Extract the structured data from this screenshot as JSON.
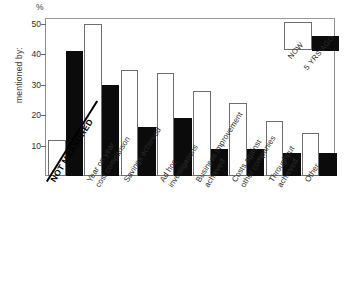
{
  "chart_data": {
    "type": "bar",
    "title": "",
    "xlabel": "",
    "ylabel": "mentioned by:",
    "yunit": "%",
    "ylim": [
      0,
      52
    ],
    "yticks": [
      10,
      20,
      30,
      40,
      50
    ],
    "grid": false,
    "legend_position": "top-right",
    "categories": [
      "NOT MEASURED",
      "Year on year cost comparison",
      "Savings achieved",
      "Ad hoc investigations",
      "Business improvement achieved",
      "Costs against other companies",
      "Throughput achieved",
      "Other"
    ],
    "category_lines": [
      [
        "NOT MEASURED"
      ],
      [
        "Year on year",
        "cost comparison"
      ],
      [
        "Savings achieved"
      ],
      [
        "Ad hoc",
        "investigations"
      ],
      [
        "Business improvement",
        "achieved"
      ],
      [
        "Costs against",
        "other companies"
      ],
      [
        "Throughput",
        "achieved"
      ],
      [
        "Other"
      ]
    ],
    "series": [
      {
        "name": "NOW",
        "color": "#ffffff",
        "values": [
          12,
          50,
          35,
          34,
          28,
          24,
          18,
          14
        ]
      },
      {
        "name": "5 YRS AGO",
        "color": "#0b0b0b",
        "values": [
          41,
          30,
          16,
          19,
          9,
          9,
          7.5,
          7.5
        ]
      }
    ]
  },
  "axis": {
    "y_title": "mentioned by:",
    "percent_symbol": "%",
    "tick_labels": [
      "50",
      "40",
      "30",
      "20",
      "10"
    ]
  },
  "legend": {
    "now_label": "NOW",
    "ago_label": "5 YRS AGO"
  }
}
